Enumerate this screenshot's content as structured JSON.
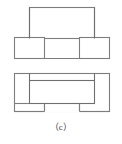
{
  "figure": {
    "caption": "（c）",
    "caption_plain": "(c)",
    "label_letter": "c",
    "type": "line-drawing",
    "stroke_color": "#7d7d7d",
    "stroke_color_dark": "#6e6e6e",
    "fill_color": "#ffffff",
    "background": "#ffffff",
    "stroke_width": 1.1,
    "canvas": {
      "width": 122,
      "height": 144
    },
    "views": [
      {
        "name": "upper-view",
        "description": "Bridge / inverted-U outline: wide top rectangle spanning between two smaller foot rectangles",
        "parts": [
          {
            "name": "top-span-rectangle",
            "x": 29.5,
            "y": 7.5,
            "width": 65,
            "height": 31
          },
          {
            "name": "left-foot-rectangle",
            "x": 14.5,
            "y": 37.5,
            "width": 30,
            "height": 21
          },
          {
            "name": "right-foot-rectangle",
            "x": 79.5,
            "y": 37.5,
            "width": 30,
            "height": 21
          }
        ]
      },
      {
        "name": "lower-view",
        "description": "Nested outline: large outer rectangle with an inner rectangle overlapping it, notches cut at the lower-left and lower-right",
        "parts": [
          {
            "name": "outer-rectangle",
            "x": 14.5,
            "y": 73.5,
            "width": 95,
            "height": 38
          },
          {
            "name": "inner-rectangle",
            "x": 29.5,
            "y": 80.5,
            "width": 65,
            "height": 23
          },
          {
            "name": "left-notch",
            "x": 14.5,
            "y": 103.5,
            "width": 30,
            "height": 8
          },
          {
            "name": "right-notch",
            "x": 79.5,
            "y": 103.5,
            "width": 30,
            "height": 8
          }
        ]
      }
    ]
  }
}
